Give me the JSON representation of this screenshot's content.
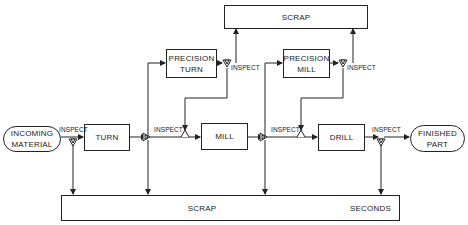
{
  "diagram": {
    "type": "process-flow",
    "nodes": {
      "incoming": "INCOMING\nMATERIAL",
      "turn": "TURN",
      "precision_turn": "PRECISION\nTURN",
      "mill": "MILL",
      "precision_mill": "PRECISION\nMILL",
      "drill": "DRILL",
      "finished": "FINISHED\nPART",
      "scrap_top": "SCRAP",
      "scrap_bottom": "SCRAP",
      "seconds": "SECONDS"
    },
    "inspect_label": "INSPECT",
    "edges": [
      {
        "from": "incoming",
        "to": "turn",
        "via": "inspect-1"
      },
      {
        "from": "inspect-1",
        "to": "scrap_bottom"
      },
      {
        "from": "turn",
        "to": "inspect-2"
      },
      {
        "from": "inspect-2",
        "to": "mill"
      },
      {
        "from": "inspect-2",
        "to": "scrap_bottom"
      },
      {
        "from": "inspect-2",
        "to": "precision_turn"
      },
      {
        "from": "precision_turn",
        "to": "inspect-3"
      },
      {
        "from": "inspect-3",
        "to": "scrap_top"
      },
      {
        "from": "inspect-3",
        "to": "mill"
      },
      {
        "from": "mill",
        "to": "inspect-4"
      },
      {
        "from": "inspect-4",
        "to": "drill"
      },
      {
        "from": "inspect-4",
        "to": "scrap_bottom"
      },
      {
        "from": "inspect-4",
        "to": "precision_mill"
      },
      {
        "from": "precision_mill",
        "to": "inspect-5"
      },
      {
        "from": "inspect-5",
        "to": "scrap_top"
      },
      {
        "from": "inspect-5",
        "to": "drill"
      },
      {
        "from": "drill",
        "to": "inspect-6"
      },
      {
        "from": "inspect-6",
        "to": "finished"
      },
      {
        "from": "inspect-6",
        "to": "seconds"
      }
    ]
  }
}
